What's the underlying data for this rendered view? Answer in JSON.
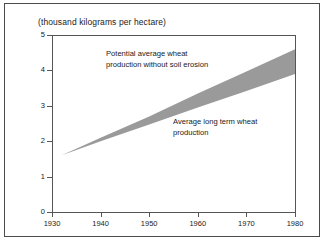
{
  "chart_data": {
    "type": "area",
    "title": "(thousand kilograms per hectare)",
    "xlabel": "",
    "ylabel": "",
    "xlim": [
      1930,
      1980
    ],
    "ylim": [
      0,
      5
    ],
    "grid": false,
    "legend_position": "none",
    "x_ticks": [
      "1930",
      "1940",
      "1950",
      "1960",
      "1970",
      "1980"
    ],
    "y_ticks": [
      "0",
      "1",
      "2",
      "3",
      "4",
      "5"
    ],
    "x": [
      1932,
      1940,
      1950,
      1960,
      1970,
      1980
    ],
    "series": [
      {
        "name": "Potential average wheat production without soil erosion",
        "values": [
          1.6,
          2.1,
          2.7,
          3.35,
          3.97,
          4.6
        ]
      },
      {
        "name": "Average long term wheat production",
        "values": [
          1.6,
          2.0,
          2.47,
          2.95,
          3.42,
          3.9
        ]
      }
    ],
    "band_fill_color": "#9a9a9a",
    "axis_color": "#555555",
    "annotations": [
      {
        "name": "potential-production-label",
        "lines": [
          "Potential average wheat",
          "production without soil erosion"
        ]
      },
      {
        "name": "actual-production-label",
        "lines": [
          "Average long term wheat",
          "production"
        ]
      }
    ]
  }
}
